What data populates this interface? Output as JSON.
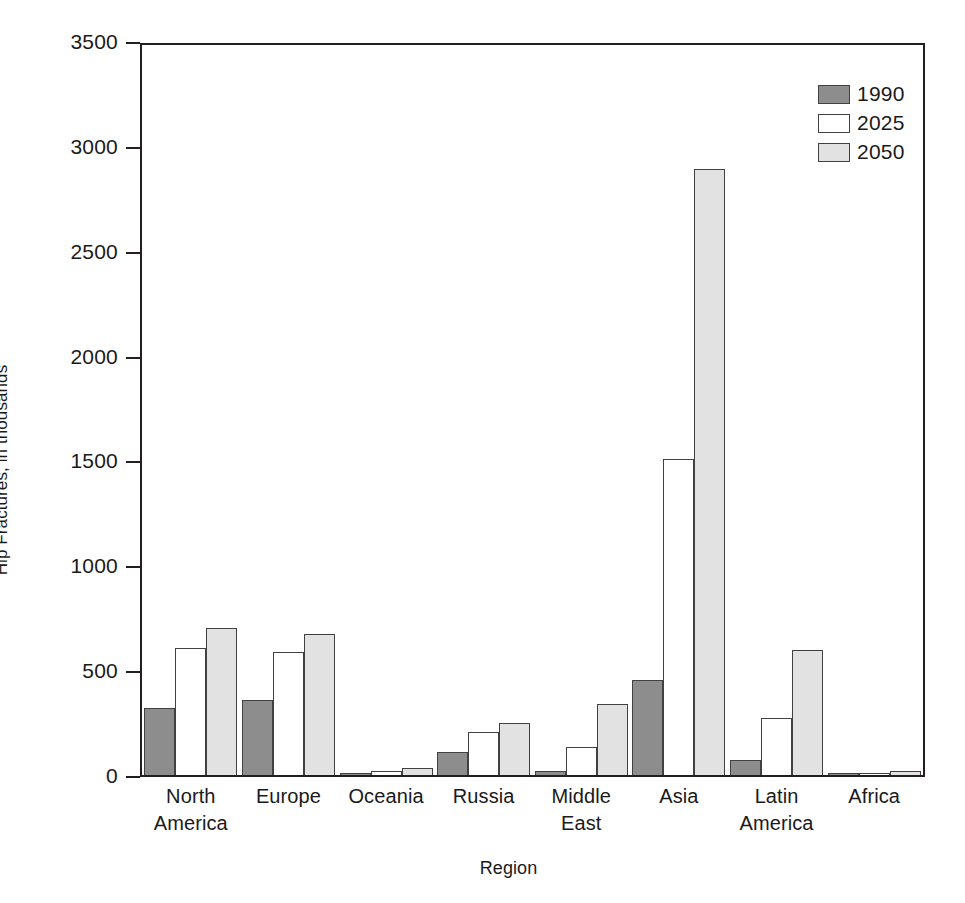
{
  "chart_data": {
    "type": "bar",
    "title": "",
    "xlabel": "Region",
    "ylabel": "Hip Fractures, in thousands",
    "ylim": [
      0,
      3500
    ],
    "ytick_step": 500,
    "yticks": [
      "3500",
      "3000",
      "2500",
      "2000",
      "1500",
      "1000",
      "500",
      "0"
    ],
    "ytick_values": [
      3500,
      3000,
      2500,
      2000,
      1500,
      1000,
      500,
      0
    ],
    "grid": false,
    "legend_position": "top-right",
    "categories": [
      "North America",
      "Europe",
      "Oceania",
      "Russia",
      "Middle East",
      "Asia",
      "Latin America",
      "Africa"
    ],
    "category_lines": [
      [
        "North",
        "America"
      ],
      [
        "Europe",
        ""
      ],
      [
        "Oceania",
        ""
      ],
      [
        "Russia",
        ""
      ],
      [
        "Middle",
        "East"
      ],
      [
        "Asia",
        ""
      ],
      [
        "Latin",
        "America"
      ],
      [
        "Africa",
        ""
      ]
    ],
    "series": [
      {
        "name": "1990",
        "color": "#8d8d8d",
        "values": [
          320,
          360,
          5,
          110,
          20,
          455,
          70,
          3
        ]
      },
      {
        "name": "2025",
        "color": "#ffffff",
        "values": [
          605,
          590,
          18,
          205,
          135,
          1510,
          275,
          5
        ]
      },
      {
        "name": "2050",
        "color": "#e2e2e2",
        "values": [
          705,
          675,
          33,
          250,
          340,
          2900,
          600,
          20
        ]
      }
    ]
  },
  "legend": {
    "items": [
      {
        "label": "1990",
        "swatch": "dark-gray"
      },
      {
        "label": "2025",
        "swatch": "white"
      },
      {
        "label": "2050",
        "swatch": "light-gray"
      }
    ]
  },
  "colors": {
    "series_1990": "#8d8d8d",
    "series_2025": "#ffffff",
    "series_2050": "#e2e2e2",
    "axis": "#231f20",
    "bar_outline": "#414042",
    "background": "#ffffff"
  }
}
